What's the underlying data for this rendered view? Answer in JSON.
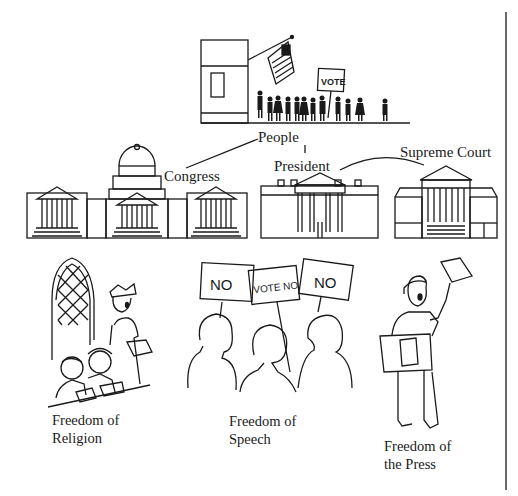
{
  "diagram": {
    "top_scene": {
      "sign_text": "VOTE",
      "label": "People"
    },
    "government": {
      "connector": "|",
      "branches": [
        {
          "label": "Congress"
        },
        {
          "label": "President"
        },
        {
          "label": "Supreme Court"
        }
      ]
    },
    "freedoms": [
      {
        "line1": "Freedom of",
        "line2": "Religion"
      },
      {
        "line1": "Freedom of",
        "line2": "Speech",
        "signs": [
          "NO",
          "VOTE NO",
          "NO"
        ]
      },
      {
        "line1": "Freedom of",
        "line2": "the Press"
      }
    ],
    "colors": {
      "ink": "#1a1a1a",
      "background": "#ffffff"
    }
  }
}
